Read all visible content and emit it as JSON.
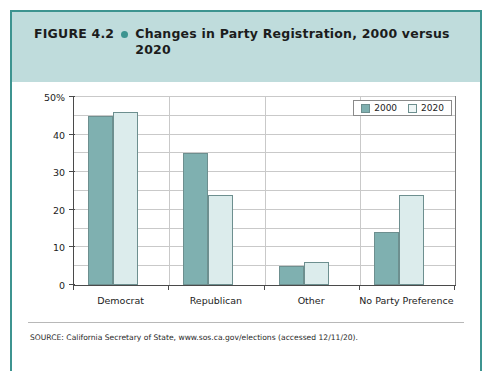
{
  "figure": {
    "label": "FIGURE 4.2",
    "bullet_icon": "bullet-dot-icon",
    "title": "Changes in Party Registration, 2000 versus 2020",
    "source": "SOURCE: California Secretary of State, www.sos.ca.gov/elections (accessed 12/11/20).",
    "accent_color": "#3d9490",
    "header_background": "#bfdcdc"
  },
  "legend": {
    "position": "top-right",
    "items": [
      {
        "label": "2000",
        "color": "#7fb0b0"
      },
      {
        "label": "2020",
        "color": "#eef6f6"
      }
    ]
  },
  "chart_data": {
    "type": "bar",
    "title": "Changes in Party Registration, 2000 versus 2020",
    "xlabel": "",
    "ylabel": "",
    "categories": [
      "Democrat",
      "Republican",
      "Other",
      "No Party Preference"
    ],
    "series": [
      {
        "name": "2000",
        "color": "#7fb0b0",
        "values": [
          45,
          35,
          5,
          14
        ]
      },
      {
        "name": "2020",
        "color": "#dcecec",
        "values": [
          46,
          24,
          6,
          24
        ]
      }
    ],
    "ylim": [
      0,
      50
    ],
    "ytick_values": [
      0,
      10,
      20,
      30,
      40,
      50
    ],
    "ytick_labels": [
      "0",
      "10",
      "20",
      "30",
      "40",
      "50%"
    ],
    "gridline_step": 5,
    "grid": true,
    "legend_position": "top-right"
  }
}
